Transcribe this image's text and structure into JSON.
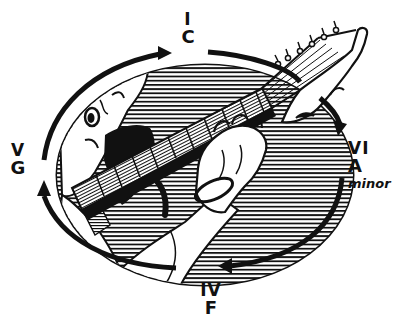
{
  "diagram": {
    "type": "chord-progression-cycle",
    "colors": {
      "ink": "#111111",
      "paper": "#ffffff"
    },
    "chords": [
      {
        "position": "top",
        "numeral": "I",
        "name": "C",
        "quality": ""
      },
      {
        "position": "right",
        "numeral": "VI",
        "name": "A",
        "quality": "minor"
      },
      {
        "position": "bottom",
        "numeral": "IV",
        "name": "F",
        "quality": ""
      },
      {
        "position": "left",
        "numeral": "V",
        "name": "G",
        "quality": ""
      }
    ],
    "arrows": [
      {
        "from": "I",
        "to": "VI",
        "direction": "clockwise",
        "icon": "curved-arrow-icon"
      },
      {
        "from": "VI",
        "to": "IV",
        "direction": "clockwise",
        "icon": "curved-arrow-icon"
      },
      {
        "from": "IV",
        "to": "V",
        "direction": "clockwise",
        "icon": "curved-arrow-icon"
      },
      {
        "from": "V",
        "to": "I",
        "direction": "clockwise",
        "icon": "curved-arrow-icon"
      }
    ],
    "illustration": {
      "subject": "guitarist fretting a chord",
      "elements": [
        "oval-frame",
        "hatched-background",
        "guitarist-face",
        "beard",
        "guitar-neck",
        "fretboard",
        "headstock",
        "tuning-pegs",
        "fretting-hand",
        "bracelet",
        "arm"
      ]
    }
  }
}
